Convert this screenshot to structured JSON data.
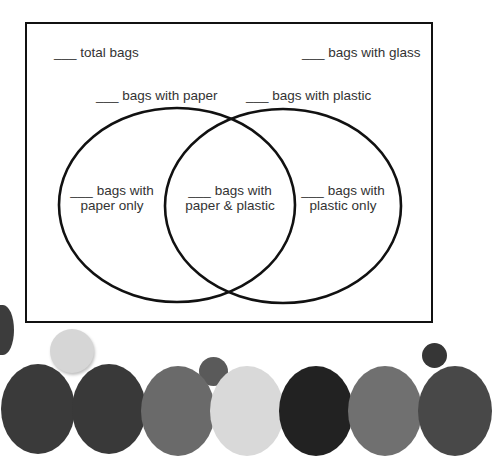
{
  "diagram": {
    "type": "venn",
    "blank": "___",
    "labels": {
      "total": "total bags",
      "glass": "bags with glass",
      "paper": "bags with paper",
      "plastic": "bags with plastic",
      "paper_only_line1": "bags with",
      "paper_only_line2": "paper only",
      "both_line1": "bags with",
      "both_line2": "paper & plastic",
      "plastic_only_line1": "bags with",
      "plastic_only_line2": "plastic only"
    },
    "sets": [
      "bags with paper",
      "bags with plastic"
    ],
    "regions": [
      "paper only",
      "paper & plastic",
      "plastic only"
    ]
  },
  "decoration": {
    "circle_colors": [
      "#3a3a3a",
      "#393939",
      "#6a6a6a",
      "#d9d9d9",
      "#222222",
      "#707070",
      "#484848",
      "#d6d6d6",
      "#5a5a5a",
      "#3c3c3c",
      "#363636"
    ]
  }
}
